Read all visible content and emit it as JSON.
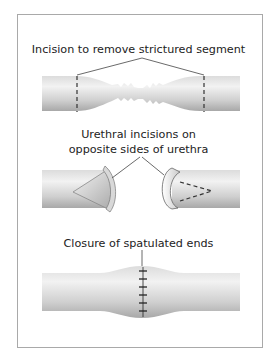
{
  "figure": {
    "panels": [
      {
        "id": "stricture",
        "label": "Incision to remove strictured segment",
        "description": "Urethra tube with narrowed strictured middle segment; dashed incision lines on each side"
      },
      {
        "id": "spatulation",
        "label_lines": [
          "Urethral incisions on",
          "opposite sides of urethra"
        ],
        "description": "Two separated urethral ends, each spatulated with an incision on opposite sides"
      },
      {
        "id": "closure",
        "label": "Closure of spatulated ends",
        "description": "Rejoined urethra with slight bulge and vertical row of sutures"
      }
    ],
    "colors": {
      "frame": "#a9a9a9",
      "tube_light": "#ececec",
      "tube_dark": "#b9b9b9",
      "line": "#333333"
    }
  }
}
